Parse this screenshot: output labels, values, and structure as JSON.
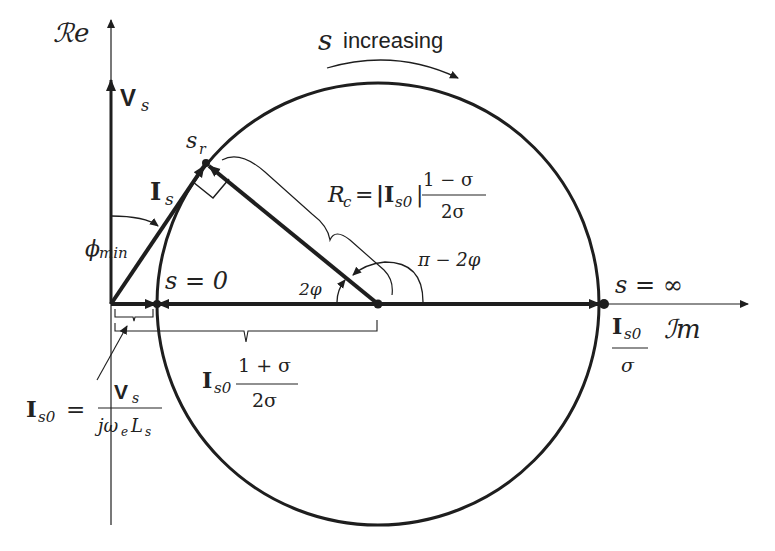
{
  "axes": {
    "real_label": "ℛe",
    "imag_label": "ℐm"
  },
  "direction": {
    "symbol": "s",
    "text": "increasing"
  },
  "vectors": {
    "voltage": {
      "main": "V",
      "sub": "s"
    },
    "current": {
      "main": "I",
      "sub": "s"
    }
  },
  "points": {
    "sr": {
      "main": "s",
      "sub": "r"
    },
    "s_zero": "s = 0",
    "s_inf": "s = ∞"
  },
  "angles": {
    "phi_min": {
      "main": "ϕ",
      "sub": "min"
    },
    "two_phi": "2φ",
    "pi_minus": "π − 2φ"
  },
  "radius_label": {
    "lhs": "R",
    "lhs_sub": "c",
    "eq": "=",
    "abs": "|I",
    "abs_sub": "s0",
    "abs_close": "|",
    "num": "1 − σ",
    "den": "2σ"
  },
  "center_label": {
    "main": "I",
    "sub": "s0",
    "num": "1 + σ",
    "den": "2σ"
  },
  "far_point_label": {
    "main": "I",
    "sub": "s0",
    "den": "σ"
  },
  "is0_label": {
    "lhs": "I",
    "lhs_sub": "s0",
    "eq": "=",
    "num_main": "V",
    "num_sub": "s",
    "den": "jω",
    "den_sub1": "e",
    "den_L": "L",
    "den_sub2": "s"
  },
  "geometry": {
    "origin": [
      110,
      304
    ],
    "circle_center": [
      378,
      304
    ],
    "circle_radius": 221,
    "sr_point": [
      206,
      163
    ],
    "stroke_color": "#1e1e1e"
  }
}
